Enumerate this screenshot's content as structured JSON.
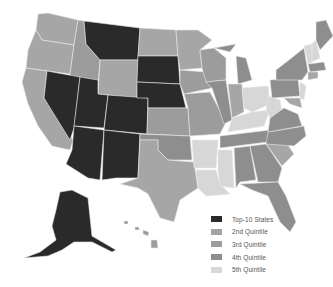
{
  "legend": {
    "items": [
      {
        "label": "Top-10 States",
        "color": "#2a2a2a"
      },
      {
        "label": "2nd Quintile",
        "color": "#a4a4a4"
      },
      {
        "label": "3rd Quintile",
        "color": "#9c9c9c"
      },
      {
        "label": "4th Quintile",
        "color": "#8e8e8e"
      },
      {
        "label": "5th Quintile",
        "color": "#d7d7d7"
      }
    ]
  },
  "classes": {
    "top10": [
      "Montana",
      "South Dakota",
      "Nebraska",
      "Nevada",
      "Utah",
      "Colorado",
      "Arizona",
      "New Mexico",
      "North Dakota",
      "Alaska"
    ],
    "light": [
      "Ohio",
      "West Virginia",
      "Kentucky",
      "Arkansas",
      "Mississippi",
      "Louisiana",
      "Vermont",
      "New Jersey"
    ]
  }
}
